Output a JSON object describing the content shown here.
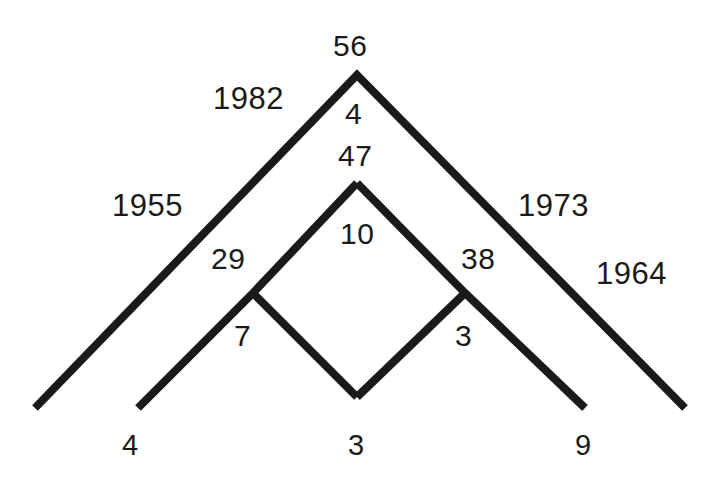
{
  "diagram": {
    "type": "chevron-tree",
    "background_color": "#ffffff",
    "line_color": "#1a1a1a",
    "line_width": 8,
    "apex_top_count": "56",
    "labels": {
      "top_count": "56",
      "apex_inner_upper": "4",
      "apex_inner_node": "47",
      "inner_chevron_count": "10",
      "left_year_upper": "1982",
      "left_year_lower": "1955",
      "right_year_upper": "1973",
      "right_year_lower": "1964",
      "left_branch_count": "29",
      "right_branch_count": "38",
      "left_diamond_count": "7",
      "right_diamond_count": "3",
      "leaf_left": "4",
      "leaf_center": "3",
      "leaf_right": "9"
    },
    "nodes": [
      {
        "name": "outer-apex",
        "label": "56",
        "x": 357,
        "y": 75
      },
      {
        "name": "inner-apex",
        "label": "47",
        "x": 357,
        "y": 183
      },
      {
        "name": "left-branch-node",
        "label": "29",
        "x": 253,
        "y": 293
      },
      {
        "name": "right-branch-node",
        "label": "38",
        "x": 465,
        "y": 293
      },
      {
        "name": "diamond-bottom",
        "label": "3",
        "x": 357,
        "y": 397
      }
    ],
    "leaves": [
      {
        "name": "leaf-far-left",
        "label": "4",
        "x": 35,
        "y": 408
      },
      {
        "name": "leaf-inner-left",
        "label": "4",
        "x": 138,
        "y": 408
      },
      {
        "name": "leaf-bottom-center",
        "label": "3",
        "x": 357,
        "y": 397
      },
      {
        "name": "leaf-inner-right",
        "label": "9",
        "x": 585,
        "y": 408
      },
      {
        "name": "leaf-far-right",
        "label": "9",
        "x": 685,
        "y": 408
      }
    ],
    "years": [
      "1982",
      "1955",
      "1973",
      "1964"
    ]
  }
}
